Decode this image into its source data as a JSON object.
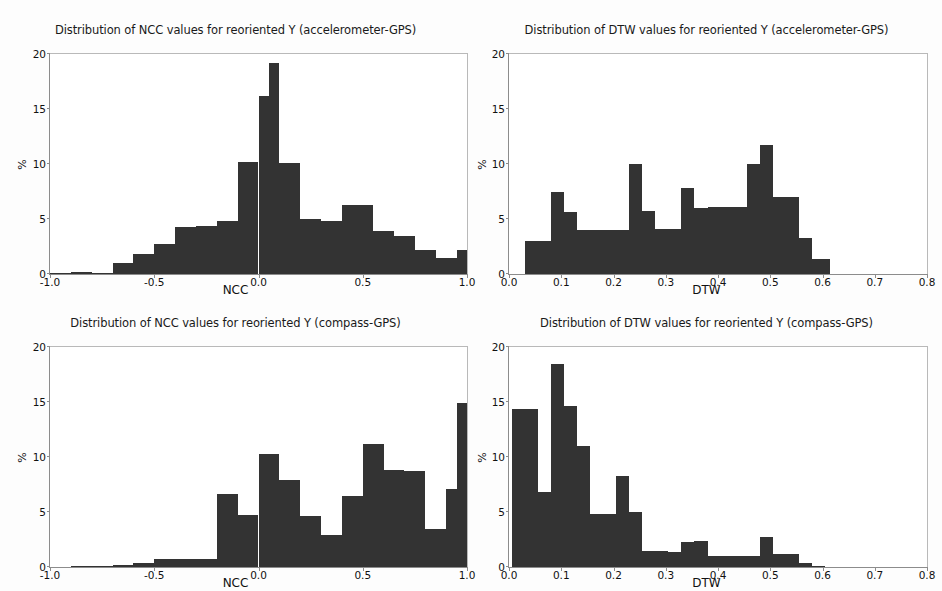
{
  "figure": {
    "width": 942,
    "height": 591,
    "background": "#ffffff",
    "bar_color": "#333333",
    "axis_color": "#8c8c8c"
  },
  "panels": [
    {
      "id": "ncc-accelerometer-gps",
      "title": "Distribution of NCC values for reoriented Y (accelerometer-GPS)",
      "xlabel": "NCC",
      "ylabel": "%"
    },
    {
      "id": "dtw-accelerometer-gps",
      "title": "Distribution of DTW values for reoriented Y (accelerometer-GPS)",
      "xlabel": "DTW",
      "ylabel": "%"
    },
    {
      "id": "ncc-compass-gps",
      "title": "Distribution of NCC values for reoriented Y (compass-GPS)",
      "xlabel": "NCC",
      "ylabel": "%"
    },
    {
      "id": "dtw-compass-gps",
      "title": "Distribution of DTW values for reoriented Y (compass-GPS)",
      "xlabel": "DTW",
      "ylabel": "%"
    }
  ],
  "axes": {
    "y_ticks": [
      "0",
      "5",
      "10",
      "15",
      "20"
    ],
    "y_tick_values": [
      0,
      5,
      10,
      15,
      20
    ],
    "ncc_x_ticks": [
      "-1.0",
      "-0.5",
      "0.0",
      "0.5",
      "1.0"
    ],
    "ncc_x_tick_values": [
      -1.0,
      -0.5,
      0.0,
      0.5,
      1.0
    ],
    "dtw_x_ticks": [
      "0.0",
      "0.1",
      "0.2",
      "0.3",
      "0.4",
      "0.5",
      "0.6",
      "0.7",
      "0.8"
    ],
    "dtw_x_tick_values": [
      0.0,
      0.1,
      0.2,
      0.3,
      0.4,
      0.5,
      0.6,
      0.7,
      0.8
    ]
  },
  "chart_data": [
    {
      "type": "bar",
      "id": "ncc-accelerometer-gps",
      "title": "Distribution of NCC values for reoriented Y (accelerometer-GPS)",
      "xlabel": "NCC",
      "ylabel": "%",
      "xlim": [
        -1.0,
        1.0
      ],
      "ylim": [
        0,
        20
      ],
      "grid": false,
      "legend": null,
      "bin_edges": [
        -1.0,
        -0.9,
        -0.8,
        -0.7,
        -0.6,
        -0.5,
        -0.4,
        -0.3,
        -0.2,
        -0.1,
        0.0,
        0.05,
        0.1,
        0.2,
        0.3,
        0.4,
        0.45,
        0.55,
        0.65,
        0.75,
        0.85,
        0.95,
        1.0
      ],
      "values": [
        0.1,
        0.2,
        0.1,
        1.0,
        1.8,
        2.7,
        4.3,
        4.4,
        4.8,
        10.2,
        16.2,
        19.2,
        10.1,
        5.0,
        4.8,
        6.3,
        6.3,
        3.9,
        3.5,
        2.2,
        1.5,
        2.2
      ]
    },
    {
      "type": "bar",
      "id": "dtw-accelerometer-gps",
      "title": "Distribution of DTW values for reoriented Y (accelerometer-GPS)",
      "xlabel": "DTW",
      "ylabel": "%",
      "xlim": [
        0.0,
        0.8
      ],
      "ylim": [
        0,
        20
      ],
      "grid": false,
      "legend": null,
      "bin_edges": [
        0.03,
        0.055,
        0.08,
        0.105,
        0.13,
        0.155,
        0.205,
        0.23,
        0.255,
        0.28,
        0.305,
        0.33,
        0.355,
        0.38,
        0.405,
        0.43,
        0.455,
        0.48,
        0.505,
        0.53,
        0.555,
        0.58,
        0.615
      ],
      "values": [
        3.0,
        3.0,
        7.5,
        5.6,
        4.0,
        4.0,
        4.0,
        10.0,
        5.7,
        4.1,
        4.1,
        7.8,
        6.0,
        6.1,
        6.1,
        6.1,
        10.0,
        11.7,
        7.0,
        7.0,
        3.3,
        1.4
      ]
    },
    {
      "type": "bar",
      "id": "ncc-compass-gps",
      "title": "Distribution of NCC values for reoriented Y (compass-GPS)",
      "xlabel": "NCC",
      "ylabel": "%",
      "xlim": [
        -1.0,
        1.0
      ],
      "ylim": [
        0,
        20
      ],
      "grid": false,
      "legend": null,
      "bin_edges": [
        -1.0,
        -0.9,
        -0.8,
        -0.7,
        -0.6,
        -0.5,
        -0.4,
        -0.3,
        -0.2,
        -0.1,
        0.0,
        0.1,
        0.2,
        0.3,
        0.4,
        0.5,
        0.6,
        0.7,
        0.8,
        0.9,
        0.95,
        1.0
      ],
      "values": [
        0.0,
        0.05,
        0.1,
        0.2,
        0.4,
        0.7,
        0.7,
        0.7,
        6.6,
        4.7,
        10.3,
        7.9,
        4.6,
        2.9,
        6.5,
        11.2,
        8.8,
        8.7,
        3.5,
        7.1,
        14.9
      ],
      "note": "bin widths 0.1 except final two of 0.05"
    },
    {
      "type": "bar",
      "id": "dtw-compass-gps",
      "title": "Distribution of DTW values for reoriented Y (compass-GPS)",
      "xlabel": "DTW",
      "ylabel": "%",
      "xlim": [
        0.0,
        0.8
      ],
      "ylim": [
        0,
        20
      ],
      "grid": false,
      "legend": null,
      "bin_edges": [
        0.005,
        0.03,
        0.055,
        0.08,
        0.105,
        0.13,
        0.155,
        0.18,
        0.205,
        0.23,
        0.255,
        0.28,
        0.305,
        0.33,
        0.355,
        0.38,
        0.405,
        0.43,
        0.455,
        0.48,
        0.505,
        0.53,
        0.555,
        0.58,
        0.605
      ],
      "values": [
        14.4,
        14.4,
        6.8,
        18.5,
        14.6,
        11.0,
        4.8,
        4.8,
        8.3,
        5.0,
        1.5,
        1.5,
        1.4,
        2.3,
        2.4,
        1.0,
        1.0,
        1.0,
        1.0,
        2.7,
        1.2,
        1.2,
        0.4,
        0.1
      ]
    }
  ]
}
